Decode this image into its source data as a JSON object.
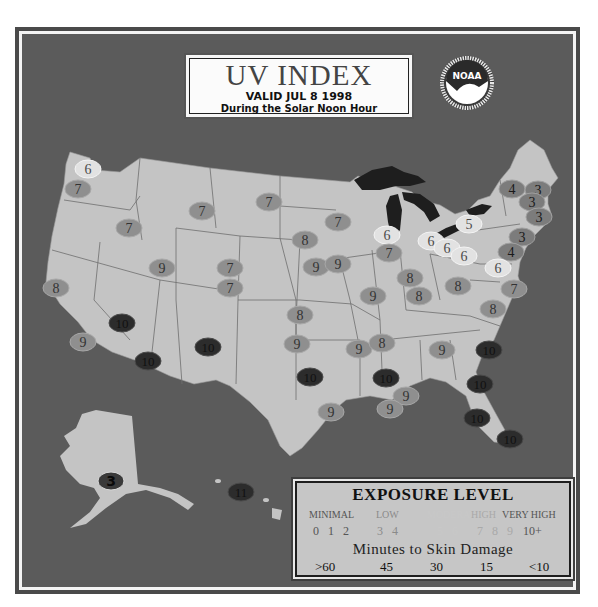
{
  "title": {
    "main": "UV INDEX",
    "valid": "VALID JUL 8 1998",
    "subtitle": "During the Solar Noon Hour"
  },
  "logo": {
    "text": "NOAA",
    "icon": "noaa-seal-icon"
  },
  "colors": {
    "background": "#5b5b5b",
    "land": "#c4c4c4",
    "lakes": "#1e1e1e",
    "state_border": "#6a6a6a",
    "level_3_4": "#7c7c7c",
    "level_5_6": "#e2e2e2",
    "level_7_9": "#8f8f8f",
    "level_10_plus": "#2c2c2c"
  },
  "legend": {
    "title": "EXPOSURE LEVEL",
    "categories": [
      {
        "label": "MINIMAL",
        "values": "0 1 2",
        "color": "#555555"
      },
      {
        "label": "LOW",
        "values": "3 4",
        "color": "#8a8a8a"
      },
      {
        "label": "MODERATE",
        "values": "5 6",
        "color": "#c8c8c8"
      },
      {
        "label": "HIGH",
        "values": "7 8 9",
        "color": "#a9a9a9"
      },
      {
        "label": "VERY HIGH",
        "values": "10+",
        "color": "#555555"
      }
    ],
    "minutes_label": "Minutes to Skin Damage",
    "minutes": [
      ">60",
      "45",
      "30",
      "15",
      "<10"
    ]
  },
  "readings": [
    {
      "v": "6",
      "x": 88,
      "y": 169,
      "lvl": "mod"
    },
    {
      "v": "7",
      "x": 78,
      "y": 189,
      "lvl": "high"
    },
    {
      "v": "7",
      "x": 129,
      "y": 228,
      "lvl": "high"
    },
    {
      "v": "7",
      "x": 202,
      "y": 211,
      "lvl": "high"
    },
    {
      "v": "7",
      "x": 269,
      "y": 202,
      "lvl": "high"
    },
    {
      "v": "7",
      "x": 338,
      "y": 222,
      "lvl": "high"
    },
    {
      "v": "8",
      "x": 305,
      "y": 240,
      "lvl": "high"
    },
    {
      "v": "6",
      "x": 387,
      "y": 235,
      "lvl": "mod"
    },
    {
      "v": "6",
      "x": 431,
      "y": 241,
      "lvl": "mod"
    },
    {
      "v": "6",
      "x": 447,
      "y": 248,
      "lvl": "mod"
    },
    {
      "v": "6",
      "x": 464,
      "y": 256,
      "lvl": "mod"
    },
    {
      "v": "5",
      "x": 469,
      "y": 224,
      "lvl": "mod"
    },
    {
      "v": "4",
      "x": 512,
      "y": 189,
      "lvl": "low"
    },
    {
      "v": "3",
      "x": 538,
      "y": 190,
      "lvl": "low"
    },
    {
      "v": "3",
      "x": 532,
      "y": 202,
      "lvl": "low"
    },
    {
      "v": "3",
      "x": 539,
      "y": 217,
      "lvl": "low"
    },
    {
      "v": "3",
      "x": 522,
      "y": 237,
      "lvl": "low"
    },
    {
      "v": "4",
      "x": 511,
      "y": 252,
      "lvl": "low"
    },
    {
      "v": "6",
      "x": 498,
      "y": 268,
      "lvl": "mod"
    },
    {
      "v": "7",
      "x": 514,
      "y": 289,
      "lvl": "high"
    },
    {
      "v": "8",
      "x": 493,
      "y": 309,
      "lvl": "high"
    },
    {
      "v": "9",
      "x": 162,
      "y": 268,
      "lvl": "high"
    },
    {
      "v": "7",
      "x": 230,
      "y": 268,
      "lvl": "high"
    },
    {
      "v": "7",
      "x": 230,
      "y": 288,
      "lvl": "high"
    },
    {
      "v": "9",
      "x": 316,
      "y": 267,
      "lvl": "high"
    },
    {
      "v": "9",
      "x": 338,
      "y": 264,
      "lvl": "high"
    },
    {
      "v": "7",
      "x": 389,
      "y": 253,
      "lvl": "high"
    },
    {
      "v": "8",
      "x": 410,
      "y": 278,
      "lvl": "high"
    },
    {
      "v": "8",
      "x": 419,
      "y": 296,
      "lvl": "high"
    },
    {
      "v": "8",
      "x": 458,
      "y": 286,
      "lvl": "high"
    },
    {
      "v": "9",
      "x": 373,
      "y": 296,
      "lvl": "high"
    },
    {
      "v": "8",
      "x": 56,
      "y": 288,
      "lvl": "high"
    },
    {
      "v": "10",
      "x": 122,
      "y": 323,
      "lvl": "vhigh"
    },
    {
      "v": "9",
      "x": 83,
      "y": 342,
      "lvl": "high"
    },
    {
      "v": "10",
      "x": 148,
      "y": 361,
      "lvl": "vhigh"
    },
    {
      "v": "10",
      "x": 208,
      "y": 347,
      "lvl": "vhigh"
    },
    {
      "v": "8",
      "x": 300,
      "y": 315,
      "lvl": "high"
    },
    {
      "v": "9",
      "x": 297,
      "y": 344,
      "lvl": "high"
    },
    {
      "v": "9",
      "x": 359,
      "y": 349,
      "lvl": "high"
    },
    {
      "v": "8",
      "x": 382,
      "y": 343,
      "lvl": "high"
    },
    {
      "v": "9",
      "x": 442,
      "y": 350,
      "lvl": "high"
    },
    {
      "v": "10",
      "x": 489,
      "y": 350,
      "lvl": "vhigh"
    },
    {
      "v": "10",
      "x": 310,
      "y": 377,
      "lvl": "vhigh"
    },
    {
      "v": "10",
      "x": 386,
      "y": 378,
      "lvl": "vhigh"
    },
    {
      "v": "10",
      "x": 480,
      "y": 384,
      "lvl": "vhigh"
    },
    {
      "v": "9",
      "x": 406,
      "y": 396,
      "lvl": "high"
    },
    {
      "v": "9",
      "x": 331,
      "y": 412,
      "lvl": "high"
    },
    {
      "v": "9",
      "x": 390,
      "y": 409,
      "lvl": "high"
    },
    {
      "v": "10",
      "x": 477,
      "y": 418,
      "lvl": "vhigh"
    },
    {
      "v": "10",
      "x": 510,
      "y": 439,
      "lvl": "vhigh"
    },
    {
      "v": "3",
      "x": 111,
      "y": 481,
      "lvl": "ak"
    },
    {
      "v": "11",
      "x": 241,
      "y": 492,
      "lvl": "vhigh"
    }
  ]
}
